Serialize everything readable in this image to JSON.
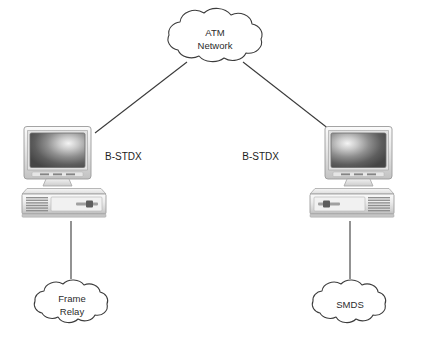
{
  "diagram": {
    "background_color": "#ffffff",
    "line_color": "#3a3a3a",
    "text_color": "#1d1d1d"
  },
  "clouds": {
    "atm": {
      "name": "atm-network-cloud",
      "line1": "ATM",
      "line2": "Network",
      "cx": 215,
      "cy": 38
    },
    "frame_relay": {
      "name": "frame-relay-cloud",
      "line1": "Frame",
      "line2": "Relay",
      "cx": 72,
      "cy": 304
    },
    "smds": {
      "name": "smds-cloud",
      "line1": "SMDS",
      "line2": "",
      "cx": 350,
      "cy": 304
    }
  },
  "nodes": [
    {
      "id": "left-switch",
      "label": "B-STDX",
      "label_x": 105,
      "label_y": 157,
      "computer_x": 18,
      "computer_y": 126
    },
    {
      "id": "right-switch",
      "label": "B-STDX",
      "label_x": 279,
      "label_y": 157,
      "computer_x": 260,
      "computer_y": 126
    }
  ],
  "links": [
    {
      "name": "atm-to-left-switch",
      "x1": 187,
      "y1": 62,
      "x2": 95,
      "y2": 133
    },
    {
      "name": "atm-to-right-switch",
      "x1": 243,
      "y1": 62,
      "x2": 334,
      "y2": 133
    },
    {
      "name": "left-switch-to-frame-relay",
      "x1": 71,
      "y1": 221,
      "x2": 71,
      "y2": 279
    },
    {
      "name": "right-switch-to-smds",
      "x1": 350,
      "y1": 221,
      "x2": 350,
      "y2": 279
    }
  ],
  "colors": {
    "monitor_bezel_light": "#f2f2f2",
    "monitor_bezel_mid": "#dcdcdc",
    "monitor_bezel_dark": "#b4b4b4",
    "screen_dark": "#4a4a4a",
    "screen_highlight": "#f0f0f0",
    "case_light": "#f4f4f4",
    "case_mid": "#dadada",
    "case_dark": "#a9a9a9",
    "outline": "#8a8a8a"
  }
}
